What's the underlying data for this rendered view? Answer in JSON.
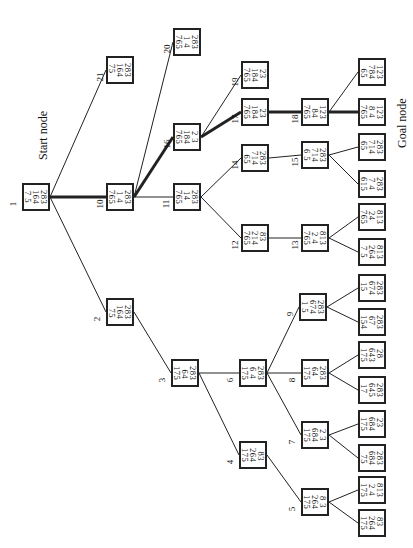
{
  "diagram": {
    "type": "search-tree",
    "orientation": "rotated-90",
    "start_label": "Start node",
    "goal_label": "Goal node",
    "nodes": [
      {
        "id": "1",
        "label": "1",
        "state": [
          "283",
          "164",
          "7 5"
        ],
        "x": 22,
        "y": 183
      },
      {
        "id": "2",
        "label": "2",
        "state": [
          "283",
          "164",
          " 75"
        ],
        "x": 106,
        "y": 298
      },
      {
        "id": "3",
        "label": "3",
        "state": [
          "283",
          " 64",
          "175"
        ],
        "x": 171,
        "y": 359
      },
      {
        "id": "4",
        "label": "4",
        "state": [
          " 83",
          "264",
          "175"
        ],
        "x": 239,
        "y": 441
      },
      {
        "id": "5",
        "label": "5",
        "state": [
          "8 3",
          "264",
          "175"
        ],
        "x": 301,
        "y": 488
      },
      {
        "id": "6",
        "label": "6",
        "state": [
          "283",
          "6 4",
          "175"
        ],
        "x": 239,
        "y": 359
      },
      {
        "id": "7",
        "label": "7",
        "state": [
          "2 3",
          "684",
          "175"
        ],
        "x": 301,
        "y": 421
      },
      {
        "id": "8",
        "label": "8",
        "state": [
          "283",
          "64 ",
          "175"
        ],
        "x": 301,
        "y": 359
      },
      {
        "id": "9",
        "label": "9",
        "state": [
          "283",
          "674",
          "1 5"
        ],
        "x": 299,
        "y": 293
      },
      {
        "id": "10",
        "label": "10",
        "state": [
          "283",
          "1 4",
          "765"
        ],
        "x": 106,
        "y": 183
      },
      {
        "id": "11",
        "label": "11",
        "state": [
          "283",
          "14 ",
          "765"
        ],
        "x": 173,
        "y": 183
      },
      {
        "id": "12",
        "label": "12",
        "state": [
          "83 ",
          "214",
          "765"
        ],
        "x": 241,
        "y": 224
      },
      {
        "id": "13",
        "label": "13",
        "state": [
          "813",
          "2 4",
          "765"
        ],
        "x": 301,
        "y": 224
      },
      {
        "id": "14",
        "label": "14",
        "state": [
          "283",
          "714",
          " 65"
        ],
        "x": 241,
        "y": 144
      },
      {
        "id": "15",
        "label": "15",
        "state": [
          "283",
          "714",
          "6 5"
        ],
        "x": 301,
        "y": 141
      },
      {
        "id": "16",
        "label": "16",
        "state": [
          "2 3",
          "184",
          "765"
        ],
        "x": 173,
        "y": 123
      },
      {
        "id": "17",
        "label": "17",
        "state": [
          " 23",
          "184",
          "765"
        ],
        "x": 241,
        "y": 98
      },
      {
        "id": "18",
        "label": "18",
        "state": [
          "123",
          " 84",
          "765"
        ],
        "x": 301,
        "y": 98
      },
      {
        "id": "19",
        "label": "19",
        "state": [
          "23 ",
          "184",
          "765"
        ],
        "x": 241,
        "y": 61
      },
      {
        "id": "20",
        "label": "20",
        "state": [
          "283",
          "1 4",
          "765"
        ],
        "x": 173,
        "y": 28
      },
      {
        "id": "21",
        "label": "21",
        "state": [
          "283",
          "164",
          "75 "
        ],
        "x": 106,
        "y": 56
      },
      {
        "id": "L18a",
        "label": "",
        "state": [
          "123",
          "784",
          " 65"
        ],
        "x": 358,
        "y": 58
      },
      {
        "id": "L18b",
        "label": "",
        "state": [
          "123",
          "8 4",
          "765"
        ],
        "x": 358,
        "y": 98
      },
      {
        "id": "L15a",
        "label": "",
        "state": [
          "283",
          "714",
          "65 "
        ],
        "x": 358,
        "y": 133
      },
      {
        "id": "L15b",
        "label": "",
        "state": [
          "283",
          "7 4",
          "615"
        ],
        "x": 358,
        "y": 170
      },
      {
        "id": "L13a",
        "label": "",
        "state": [
          "813",
          "24 ",
          "765"
        ],
        "x": 358,
        "y": 203
      },
      {
        "id": "L13b",
        "label": "",
        "state": [
          "813",
          "264",
          "7 5"
        ],
        "x": 358,
        "y": 238
      },
      {
        "id": "L9a",
        "label": "",
        "state": [
          "283",
          "674",
          "15 "
        ],
        "x": 358,
        "y": 274
      },
      {
        "id": "L9b",
        "label": "",
        "state": [
          "283",
          "67 ",
          "154"
        ],
        "x": 358,
        "y": 308
      },
      {
        "id": "L8a",
        "label": "",
        "state": [
          "28 ",
          "643",
          "175"
        ],
        "x": 358,
        "y": 341
      },
      {
        "id": "L8b",
        "label": "",
        "state": [
          "283",
          "645",
          "17 "
        ],
        "x": 358,
        "y": 376
      },
      {
        "id": "L7a",
        "label": "",
        "state": [
          "23 ",
          "684",
          "175"
        ],
        "x": 358,
        "y": 410
      },
      {
        "id": "L7b",
        "label": "",
        "state": [
          "283",
          "684",
          " 75"
        ],
        "x": 358,
        "y": 444
      },
      {
        "id": "L5a",
        "label": "",
        "state": [
          "813",
          "2 4",
          "175"
        ],
        "x": 358,
        "y": 476
      },
      {
        "id": "L5b",
        "label": "",
        "state": [
          "83 ",
          "264",
          "175"
        ],
        "x": 358,
        "y": 509
      }
    ],
    "edges": [
      {
        "from": "1",
        "to": "2"
      },
      {
        "from": "1",
        "to": "10",
        "bold": true
      },
      {
        "from": "1",
        "to": "21"
      },
      {
        "from": "2",
        "to": "3"
      },
      {
        "from": "3",
        "to": "4"
      },
      {
        "from": "3",
        "to": "6"
      },
      {
        "from": "4",
        "to": "5"
      },
      {
        "from": "6",
        "to": "7"
      },
      {
        "from": "6",
        "to": "8"
      },
      {
        "from": "6",
        "to": "9"
      },
      {
        "from": "10",
        "to": "11"
      },
      {
        "from": "10",
        "to": "16",
        "bold": true
      },
      {
        "from": "10",
        "to": "20"
      },
      {
        "from": "11",
        "to": "12"
      },
      {
        "from": "11",
        "to": "14"
      },
      {
        "from": "12",
        "to": "13"
      },
      {
        "from": "14",
        "to": "15"
      },
      {
        "from": "16",
        "to": "17",
        "bold": true
      },
      {
        "from": "16",
        "to": "19"
      },
      {
        "from": "17",
        "to": "18",
        "bold": true
      },
      {
        "from": "18",
        "to": "L18a"
      },
      {
        "from": "18",
        "to": "L18b",
        "bold": true
      },
      {
        "from": "15",
        "to": "L15a"
      },
      {
        "from": "15",
        "to": "L15b"
      },
      {
        "from": "13",
        "to": "L13a"
      },
      {
        "from": "13",
        "to": "L13b"
      },
      {
        "from": "9",
        "to": "L9a"
      },
      {
        "from": "9",
        "to": "L9b"
      },
      {
        "from": "8",
        "to": "L8a"
      },
      {
        "from": "8",
        "to": "L8b"
      },
      {
        "from": "7",
        "to": "L7a"
      },
      {
        "from": "7",
        "to": "L7b"
      },
      {
        "from": "5",
        "to": "L5a"
      },
      {
        "from": "5",
        "to": "L5b"
      }
    ]
  },
  "colors": {
    "line": "#222222",
    "background": "#ffffff"
  }
}
